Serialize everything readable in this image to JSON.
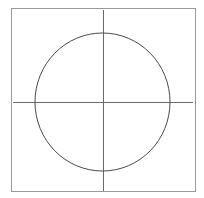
{
  "diagram": {
    "type": "circle-with-axes",
    "canvas": {
      "width": 204,
      "height": 198,
      "background": "#ffffff"
    },
    "frame": {
      "x": 11,
      "y": 8,
      "width": 184,
      "height": 183,
      "stroke": "#9a9a9a",
      "stroke_width": 1
    },
    "horizontal_axis": {
      "x1": 13,
      "y": 102,
      "x2": 193,
      "stroke": "#6a6a6a",
      "stroke_width": 1
    },
    "vertical_axis": {
      "x": 103,
      "y1": 10,
      "y2": 191,
      "stroke": "#6a6a6a",
      "stroke_width": 1
    },
    "circle": {
      "cx": 102.5,
      "cy": 102,
      "rx": 67.5,
      "ry": 69,
      "stroke": "#4a4a4a",
      "stroke_width": 1,
      "fill": "none"
    }
  }
}
